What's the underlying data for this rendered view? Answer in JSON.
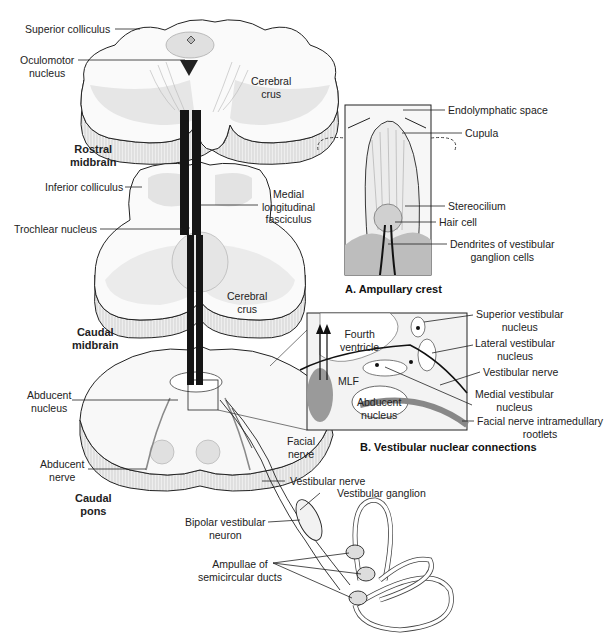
{
  "figure": {
    "type": "anatomical-diagram",
    "levels": {
      "rostral_midbrain": "Rostral\nmidbrain",
      "caudal_midbrain": "Caudal\nmidbrain",
      "caudal_pons": "Caudal\npons"
    },
    "labels": {
      "superior_colliculus": "Superior colliculus",
      "oculomotor_nucleus": "Oculomotor\nnucleus",
      "cerebral_crus_1": "Cerebral\ncrus",
      "inferior_colliculus": "Inferior colliculus",
      "mlf_full": "Medial\nlongitudinal\nfasciculus",
      "trochlear_nucleus": "Trochlear nucleus",
      "cerebral_crus_2": "Cerebral\ncrus",
      "abducent_nucleus": "Abducent\nnucleus",
      "abducent_nerve": "Abducent\nnerve",
      "facial_nerve": "Facial\nnerve",
      "vestibular_nerve_lower": "Vestibular nerve",
      "vestibular_ganglion": "Vestibular ganglion",
      "bipolar_neuron": "Bipolar vestibular\nneuron",
      "ampullae": "Ampullae of\nsemicircular ducts"
    },
    "panel_a": {
      "caption": "A.  Ampullary crest",
      "labels": {
        "endolymphatic_space": "Endolymphatic space",
        "cupula": "Cupula",
        "stereocilium": "Stereocilium",
        "hair_cell": "Hair cell",
        "dendrites": "Dendrites of vestibular\nganglion cells"
      }
    },
    "panel_b": {
      "caption": "B. Vestibular nuclear connections",
      "labels": {
        "fourth_ventricle": "Fourth\nventricle",
        "mlf": "MLF",
        "abducent_nucleus": "Abducent\nnucleus",
        "superior_vestibular": "Superior vestibular\nnucleus",
        "lateral_vestibular": "Lateral vestibular\nnucleus",
        "vestibular_nerve": "Vestibular nerve",
        "medial_vestibular": "Medial vestibular\nnucleus",
        "facial_rootlets": "Facial nerve intramedullary\nrootlets"
      }
    },
    "colors": {
      "line": "#1a1a1a",
      "tissue_light": "#f2f2f2",
      "tissue_mid": "#d9d9d9",
      "tissue_dark": "#9a9a9a",
      "tract": "#151515"
    }
  }
}
